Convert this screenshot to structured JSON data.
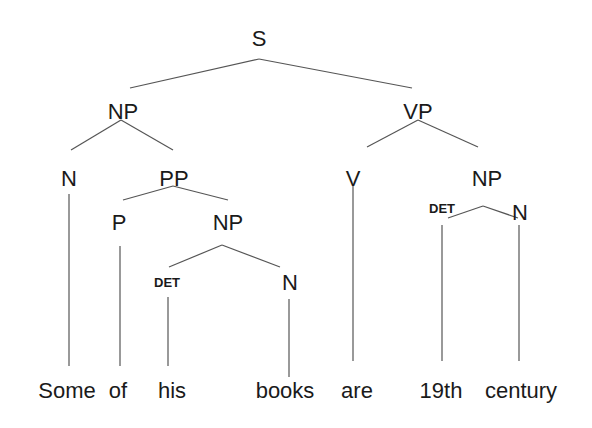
{
  "diagram": {
    "type": "syntax-tree",
    "sentence": "Some of his books are 19th century",
    "nodes": {
      "s": "S",
      "np_subj": "NP",
      "vp": "VP",
      "n_some": "N",
      "pp": "PP",
      "v": "V",
      "np_obj": "NP",
      "p": "P",
      "np_inner": "NP",
      "det_obj": "DET",
      "n_obj": "N",
      "det_inner": "DET",
      "n_inner": "N"
    },
    "words": [
      "Some",
      "of",
      "his",
      "books",
      "are",
      "19th",
      "century"
    ],
    "colors": {
      "text": "#1a1a1a",
      "edge": "#555555",
      "background": "#ffffff"
    }
  }
}
